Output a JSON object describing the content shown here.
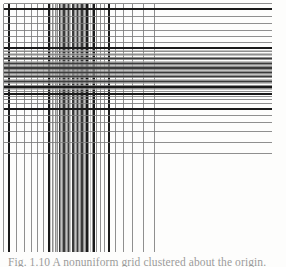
{
  "figure": {
    "caption": "Fig. 1.10  A nonuniform grid clustered about the origin."
  },
  "chart_data": {
    "type": "line",
    "subtitle": "",
    "xlabel": "",
    "ylabel": "",
    "grid": true,
    "legend_position": "none",
    "axis_style": {
      "x_range": [
        0,
        100
      ],
      "y_range": [
        0,
        100
      ],
      "frame_x": [
        3.5,
        94.0
      ],
      "frame_y": [
        8.6,
        95.0
      ]
    },
    "stroke_colors": {
      "heavy": "#1a1a1a",
      "medium": "#3a3a3a",
      "light": "#7b7b7b",
      "faint": "#a8a8a8",
      "background": "#fdfdfc"
    },
    "stroke_widths": {
      "heavy": 2.1,
      "medium": 1.35,
      "light": 0.85,
      "faint": 0.7
    },
    "vertical_lines": [
      {
        "x": 3.5,
        "w": "light"
      },
      {
        "x": 8.7,
        "w": "heavy"
      },
      {
        "x": 16.6,
        "w": "light"
      },
      {
        "x": 24.1,
        "w": "light"
      },
      {
        "x": 31.0,
        "w": "light"
      },
      {
        "x": 37.4,
        "w": "light"
      },
      {
        "x": 43.4,
        "w": "light"
      },
      {
        "x": 49.0,
        "w": "heavy"
      },
      {
        "x": 50.7,
        "w": "faint"
      },
      {
        "x": 52.3,
        "w": "light"
      },
      {
        "x": 53.8,
        "w": "faint"
      },
      {
        "x": 55.2,
        "w": "light"
      },
      {
        "x": 56.6,
        "w": "faint"
      },
      {
        "x": 57.9,
        "w": "light"
      },
      {
        "x": 59.2,
        "w": "medium"
      },
      {
        "x": 60.5,
        "w": "light"
      },
      {
        "x": 61.7,
        "w": "faint"
      },
      {
        "x": 62.9,
        "w": "light"
      },
      {
        "x": 64.1,
        "w": "medium"
      },
      {
        "x": 65.3,
        "w": "light"
      },
      {
        "x": 66.4,
        "w": "faint"
      },
      {
        "x": 67.6,
        "w": "light"
      },
      {
        "x": 68.7,
        "w": "medium"
      },
      {
        "x": 69.8,
        "w": "light"
      },
      {
        "x": 70.9,
        "w": "faint"
      },
      {
        "x": 72.0,
        "w": "light"
      },
      {
        "x": 73.1,
        "w": "medium"
      },
      {
        "x": 74.2,
        "w": "light"
      },
      {
        "x": 75.3,
        "w": "faint"
      },
      {
        "x": 76.4,
        "w": "light"
      },
      {
        "x": 77.5,
        "w": "medium"
      },
      {
        "x": 78.6,
        "w": "light"
      },
      {
        "x": 79.7,
        "w": "faint"
      },
      {
        "x": 80.9,
        "w": "light"
      },
      {
        "x": 82.1,
        "w": "medium"
      },
      {
        "x": 83.3,
        "w": "light"
      },
      {
        "x": 84.6,
        "w": "faint"
      },
      {
        "x": 85.9,
        "w": "light"
      },
      {
        "x": 87.3,
        "w": "heavy"
      },
      {
        "x": 88.9,
        "w": "light"
      },
      {
        "x": 90.6,
        "w": "faint"
      },
      {
        "x": 92.4,
        "w": "light"
      },
      {
        "x": 94.4,
        "w": "heavy"
      },
      {
        "x": 96.9,
        "w": "light"
      },
      {
        "x": 100.2,
        "w": "light"
      },
      {
        "x": 104.3,
        "w": "light"
      },
      {
        "x": 109.4,
        "w": "heavy"
      },
      {
        "x": 115.8,
        "w": "light"
      },
      {
        "x": 123.5,
        "w": "light"
      },
      {
        "x": 132.6,
        "w": "light"
      },
      {
        "x": 143.0,
        "w": "light"
      },
      {
        "x": 154.5,
        "w": "light"
      }
    ],
    "horizontal_lines": [
      {
        "y": 3.5,
        "w": "light"
      },
      {
        "y": 8.6,
        "w": "heavy"
      },
      {
        "y": 16.4,
        "w": "light"
      },
      {
        "y": 23.8,
        "w": "light"
      },
      {
        "y": 30.6,
        "w": "light"
      },
      {
        "y": 36.9,
        "w": "light"
      },
      {
        "y": 42.8,
        "w": "light"
      },
      {
        "y": 48.3,
        "w": "heavy"
      },
      {
        "y": 50.0,
        "w": "faint"
      },
      {
        "y": 51.6,
        "w": "light"
      },
      {
        "y": 53.1,
        "w": "faint"
      },
      {
        "y": 54.5,
        "w": "light"
      },
      {
        "y": 55.9,
        "w": "faint"
      },
      {
        "y": 57.2,
        "w": "light"
      },
      {
        "y": 58.5,
        "w": "medium"
      },
      {
        "y": 59.8,
        "w": "light"
      },
      {
        "y": 61.0,
        "w": "faint"
      },
      {
        "y": 62.2,
        "w": "light"
      },
      {
        "y": 63.4,
        "w": "medium"
      },
      {
        "y": 64.6,
        "w": "light"
      },
      {
        "y": 65.7,
        "w": "faint"
      },
      {
        "y": 66.9,
        "w": "light"
      },
      {
        "y": 68.0,
        "w": "medium"
      },
      {
        "y": 69.1,
        "w": "light"
      },
      {
        "y": 70.2,
        "w": "faint"
      },
      {
        "y": 71.3,
        "w": "light"
      },
      {
        "y": 72.4,
        "w": "medium"
      },
      {
        "y": 73.5,
        "w": "light"
      },
      {
        "y": 74.6,
        "w": "faint"
      },
      {
        "y": 75.7,
        "w": "light"
      },
      {
        "y": 76.8,
        "w": "medium"
      },
      {
        "y": 77.9,
        "w": "light"
      },
      {
        "y": 79.0,
        "w": "faint"
      },
      {
        "y": 80.2,
        "w": "light"
      },
      {
        "y": 81.4,
        "w": "medium"
      },
      {
        "y": 82.6,
        "w": "light"
      },
      {
        "y": 83.9,
        "w": "faint"
      },
      {
        "y": 85.2,
        "w": "light"
      },
      {
        "y": 86.6,
        "w": "heavy"
      },
      {
        "y": 88.2,
        "w": "light"
      },
      {
        "y": 89.9,
        "w": "faint"
      },
      {
        "y": 91.7,
        "w": "light"
      },
      {
        "y": 93.7,
        "w": "heavy"
      },
      {
        "y": 96.2,
        "w": "light"
      },
      {
        "y": 99.5,
        "w": "light"
      },
      {
        "y": 103.6,
        "w": "light"
      },
      {
        "y": 108.7,
        "w": "heavy"
      },
      {
        "y": 115.1,
        "w": "light"
      },
      {
        "y": 122.8,
        "w": "light"
      },
      {
        "y": 131.9,
        "w": "light"
      },
      {
        "y": 142.3,
        "w": "light"
      },
      {
        "y": 153.8,
        "w": "light"
      }
    ]
  }
}
